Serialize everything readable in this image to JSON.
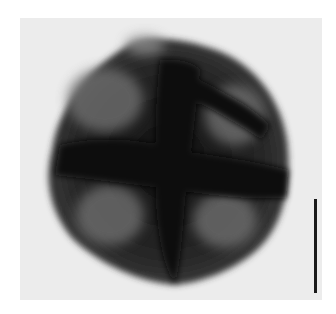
{
  "image": {
    "subject": "pollen grain micrograph",
    "background_color": "#ececec",
    "grain_color": "#2a2a2a",
    "highlight_color": "#7a7a7a"
  },
  "scale_bar": {
    "label": "",
    "color": "#1a1a1a"
  }
}
